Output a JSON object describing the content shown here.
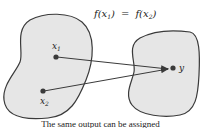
{
  "diagram": {
    "equation": "f(x₁) = f(x₂)",
    "equation_parts": {
      "lhs_f": "f(x",
      "lhs_sub": "1",
      "close": ")",
      "eq": "=",
      "rhs_f": "f(x",
      "rhs_sub": "2"
    },
    "points": {
      "x1": {
        "label": "x",
        "sub": "1"
      },
      "x2": {
        "label": "x",
        "sub": "2"
      },
      "y": {
        "label": "y"
      }
    },
    "caption": "The same output can be assigned",
    "colors": {
      "fill": "#e6e6e6",
      "stroke": "#3a3a3a",
      "point": "#3a3a3a"
    }
  }
}
